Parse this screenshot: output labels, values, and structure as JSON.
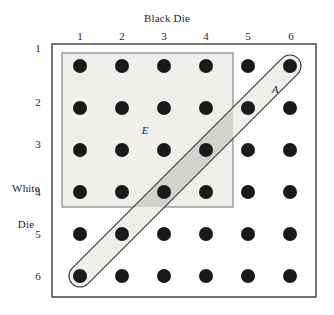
{
  "figure": {
    "type": "sample-space-grid",
    "x_axis_title": "Black Die",
    "y_axis_title_line1": "White",
    "y_axis_title_line2": "Die",
    "column_ticks": [
      "1",
      "2",
      "3",
      "4",
      "5",
      "6"
    ],
    "row_ticks": [
      "1",
      "2",
      "3",
      "4",
      "5",
      "6"
    ],
    "region_labels": {
      "event_a": "A",
      "event_e": "E"
    },
    "colors": {
      "background": "#ffffff",
      "outer_frame_stroke": "#2b2b2b",
      "dot_fill": "#1a1a1a",
      "event_e_fill": "#f0efec",
      "event_e_stroke": "#8c8c8c",
      "event_a_fill": "#efeeeb",
      "event_a_stroke": "#3a3a3a",
      "overlap_fill": "#d4d2cf",
      "text": "#1d1d1d"
    },
    "geometry": {
      "outer_frame": {
        "x": 52,
        "y": 44,
        "width": 264,
        "height": 253
      },
      "event_e_rect": {
        "x": 62,
        "y": 53,
        "width": 171,
        "height": 154
      },
      "grid_origin": {
        "x": 80,
        "y": 66
      },
      "grid_step_x": 42,
      "grid_step_y": 42,
      "dot_radius": 7,
      "event_a_band_half_width": 11
    },
    "grid_points": [
      {
        "black": 1,
        "white": 1,
        "in_event_a": false,
        "in_event_e": true
      },
      {
        "black": 2,
        "white": 1,
        "in_event_a": false,
        "in_event_e": true
      },
      {
        "black": 3,
        "white": 1,
        "in_event_a": false,
        "in_event_e": true
      },
      {
        "black": 4,
        "white": 1,
        "in_event_a": false,
        "in_event_e": true
      },
      {
        "black": 5,
        "white": 1,
        "in_event_a": false,
        "in_event_e": false
      },
      {
        "black": 6,
        "white": 1,
        "in_event_a": true,
        "in_event_e": false
      },
      {
        "black": 1,
        "white": 2,
        "in_event_a": false,
        "in_event_e": true
      },
      {
        "black": 2,
        "white": 2,
        "in_event_a": false,
        "in_event_e": true
      },
      {
        "black": 3,
        "white": 2,
        "in_event_a": false,
        "in_event_e": true
      },
      {
        "black": 4,
        "white": 2,
        "in_event_a": false,
        "in_event_e": true
      },
      {
        "black": 5,
        "white": 2,
        "in_event_a": true,
        "in_event_e": false
      },
      {
        "black": 6,
        "white": 2,
        "in_event_a": false,
        "in_event_e": false
      },
      {
        "black": 1,
        "white": 3,
        "in_event_a": false,
        "in_event_e": true
      },
      {
        "black": 2,
        "white": 3,
        "in_event_a": false,
        "in_event_e": true
      },
      {
        "black": 3,
        "white": 3,
        "in_event_a": false,
        "in_event_e": true
      },
      {
        "black": 4,
        "white": 3,
        "in_event_a": true,
        "in_event_e": true
      },
      {
        "black": 5,
        "white": 3,
        "in_event_a": false,
        "in_event_e": false
      },
      {
        "black": 6,
        "white": 3,
        "in_event_a": false,
        "in_event_e": false
      },
      {
        "black": 1,
        "white": 4,
        "in_event_a": false,
        "in_event_e": true
      },
      {
        "black": 2,
        "white": 4,
        "in_event_a": false,
        "in_event_e": true
      },
      {
        "black": 3,
        "white": 4,
        "in_event_a": true,
        "in_event_e": true
      },
      {
        "black": 4,
        "white": 4,
        "in_event_a": false,
        "in_event_e": true
      },
      {
        "black": 5,
        "white": 4,
        "in_event_a": false,
        "in_event_e": false
      },
      {
        "black": 6,
        "white": 4,
        "in_event_a": false,
        "in_event_e": false
      },
      {
        "black": 1,
        "white": 5,
        "in_event_a": false,
        "in_event_e": false
      },
      {
        "black": 2,
        "white": 5,
        "in_event_a": true,
        "in_event_e": false
      },
      {
        "black": 3,
        "white": 5,
        "in_event_a": false,
        "in_event_e": false
      },
      {
        "black": 4,
        "white": 5,
        "in_event_a": false,
        "in_event_e": false
      },
      {
        "black": 5,
        "white": 5,
        "in_event_a": false,
        "in_event_e": false
      },
      {
        "black": 6,
        "white": 5,
        "in_event_a": false,
        "in_event_e": false
      },
      {
        "black": 1,
        "white": 6,
        "in_event_a": true,
        "in_event_e": false
      },
      {
        "black": 2,
        "white": 6,
        "in_event_a": false,
        "in_event_e": false
      },
      {
        "black": 3,
        "white": 6,
        "in_event_a": false,
        "in_event_e": false
      },
      {
        "black": 4,
        "white": 6,
        "in_event_a": false,
        "in_event_e": false
      },
      {
        "black": 5,
        "white": 6,
        "in_event_a": false,
        "in_event_e": false
      },
      {
        "black": 6,
        "white": 6,
        "in_event_a": false,
        "in_event_e": false
      }
    ]
  }
}
